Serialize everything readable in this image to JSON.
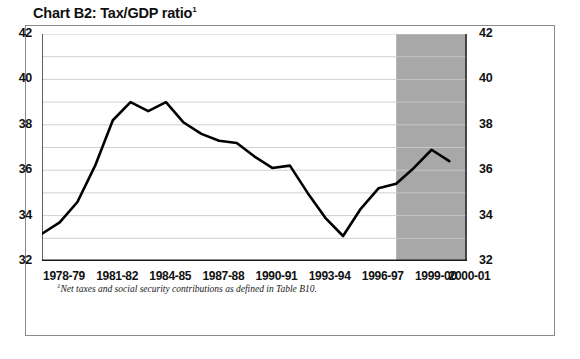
{
  "chart_data": {
    "type": "line",
    "title": "Chart B2: Tax/GDP ratio",
    "title_superscript": "1",
    "xlabel": "",
    "ylabel": "",
    "ylim": [
      32,
      42
    ],
    "ytick_step": 2,
    "yminor_step": 1,
    "grid": true,
    "legend": "none",
    "footnote_marker": "1",
    "footnote": "Net taxes and social security contributions as defined in Table B10.",
    "yticks": [
      32,
      34,
      36,
      38,
      40,
      42
    ],
    "yticks_right": [
      32,
      34,
      36,
      38,
      40,
      42
    ],
    "xtick_labels": [
      "1978-79",
      "1981-82",
      "1984-85",
      "1987-88",
      "1990-91",
      "1993-94",
      "1996-97",
      "1999-00",
      "2000-01"
    ],
    "xtick_label_years": [
      "1978-79",
      "1981-82",
      "1984-85",
      "1987-88",
      "1990-91",
      "1993-94",
      "1996-97",
      "1999-00",
      "2000-01"
    ],
    "categories": [
      "1978-79",
      "1979-80",
      "1980-81",
      "1981-82",
      "1982-83",
      "1983-84",
      "1984-85",
      "1985-86",
      "1986-87",
      "1987-88",
      "1988-89",
      "1989-90",
      "1990-91",
      "1991-92",
      "1992-93",
      "1993-94",
      "1994-95",
      "1995-96",
      "1996-97",
      "1997-98",
      "1998-99",
      "1999-00",
      "2000-01"
    ],
    "values": [
      33.2,
      33.7,
      34.6,
      36.2,
      38.2,
      39.0,
      38.6,
      39.0,
      38.1,
      37.6,
      37.3,
      37.2,
      36.6,
      36.1,
      36.2,
      35.0,
      33.9,
      33.1,
      34.3,
      35.2,
      35.4,
      36.1,
      36.9
    ],
    "projection_values": [
      36.9,
      36.4,
      36.5,
      36.8
    ],
    "projection_start_category": "1998-99",
    "shaded_region": {
      "label": "projection-band",
      "start_category": "1998-99",
      "end_category": "2001-02",
      "color": "#a8a8a8"
    },
    "series": [
      {
        "name": "Tax/GDP ratio",
        "color": "#000000",
        "x": [
          1978,
          1979,
          1980,
          1981,
          1982,
          1983,
          1984,
          1985,
          1986,
          1987,
          1988,
          1989,
          1990,
          1991,
          1992,
          1993,
          1994,
          1995,
          1996,
          1997,
          1998,
          1999,
          2000,
          2001
        ],
        "values": [
          33.2,
          33.7,
          34.6,
          36.2,
          38.2,
          39.0,
          38.6,
          39.0,
          38.1,
          37.6,
          37.3,
          37.2,
          36.6,
          36.1,
          36.2,
          35.0,
          33.9,
          33.1,
          34.3,
          35.2,
          35.4,
          36.1,
          36.9,
          36.4
        ]
      }
    ],
    "xlim_years": [
      1978,
      2002
    ],
    "colors": {
      "line": "#000000",
      "grid": "#c9c9c9",
      "axis": "#1a1a1a",
      "shading": "#a8a8a8",
      "frame": "#8a8a8a",
      "background": "#ffffff"
    }
  }
}
